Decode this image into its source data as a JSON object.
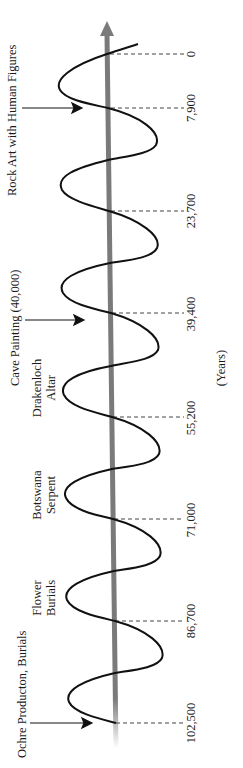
{
  "diagram": {
    "type": "sinusoidal timeline",
    "orientation": "vertical axis, text rotated 90° counter-clockwise",
    "axis_label": "(Years)",
    "colors": {
      "axis": "#7a7a7a",
      "wave": "#111111",
      "text": "#1a1a1a",
      "dashes": "#444444"
    },
    "ticks": [
      {
        "label": "0"
      },
      {
        "label": "7,900"
      },
      {
        "label": "23,700"
      },
      {
        "label": "39,400"
      },
      {
        "label": "55,200"
      },
      {
        "label": "71,000"
      },
      {
        "label": "86,700"
      },
      {
        "label": "102,500"
      }
    ],
    "events": [
      {
        "label": "Rock Art with Human Figures",
        "has_arrow": true
      },
      {
        "label": "Cave Painting (40,000)",
        "has_arrow": true
      },
      {
        "line1": "Drakenloch",
        "line2": "Altar"
      },
      {
        "line1": "Botswana",
        "line2": "Serpent"
      },
      {
        "line1": "Flower",
        "line2": "Burials"
      },
      {
        "label": "Ochre Producton, Burials",
        "has_arrow": true
      }
    ]
  }
}
